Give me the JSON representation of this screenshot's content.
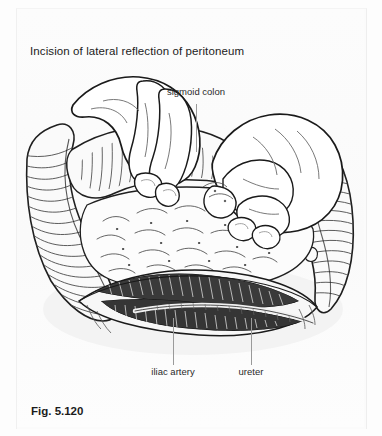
{
  "figure": {
    "title": "Incision of lateral reflection of peritoneum",
    "caption": "Fig. 5.120",
    "illustration_name": "surgical-illustration-sigmoid-mobilization",
    "colors": {
      "page_background": "#fdfdfd",
      "panel_background": "#fbfbfb",
      "ink": "#1b1b1b",
      "leader_line": "#9a9a9a",
      "hatching": "#555555",
      "deep_structure": "#2e2e2e"
    }
  },
  "labels": [
    {
      "id": "sigmoid-colon",
      "text": "sigmoid colon",
      "position": "top-center",
      "leader": "vertical-down"
    },
    {
      "id": "iliac-artery",
      "text": "iliac artery",
      "position": "bottom-left",
      "leader": "vertical-up"
    },
    {
      "id": "ureter",
      "text": "ureter",
      "position": "bottom-right",
      "leader": "vertical-up"
    }
  ]
}
